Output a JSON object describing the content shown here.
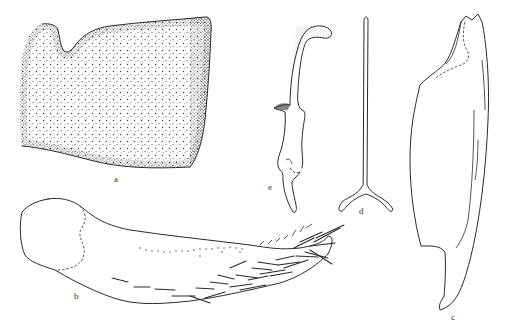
{
  "figure": {
    "panels": [
      {
        "id": "a",
        "label": "a",
        "description": "stippled plate with notch on upper left lobe"
      },
      {
        "id": "b",
        "label": "b",
        "description": "elongated segment with setae at distal end"
      },
      {
        "id": "c",
        "label": "c",
        "description": "tall sclerite with toothed apex"
      },
      {
        "id": "d",
        "label": "d",
        "description": "Y-shaped forked stalk"
      },
      {
        "id": "e",
        "label": "e",
        "description": "curved hook-like appendage"
      }
    ],
    "colors": {
      "ink": "#2a2a2a",
      "background": "#ffffff",
      "label": "#333333"
    }
  }
}
